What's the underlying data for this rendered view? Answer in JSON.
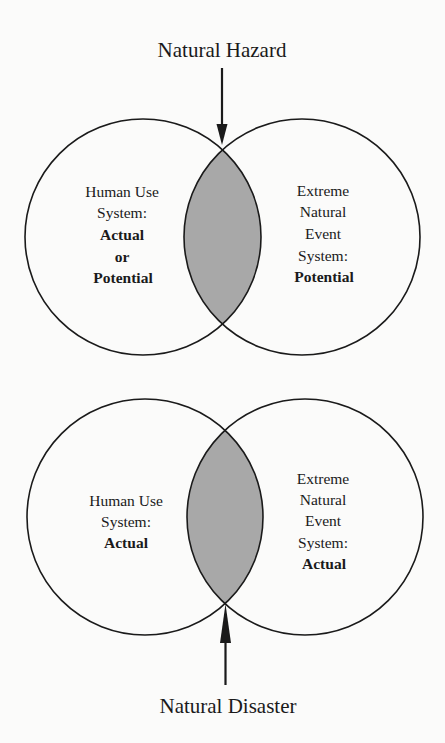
{
  "diagrams": [
    {
      "title": "Natural Hazard",
      "arrow_direction": "down",
      "left_circle": {
        "lines": [
          "Human Use",
          "System:",
          "Actual",
          "or",
          "Potential"
        ],
        "bold_from": 2
      },
      "right_circle": {
        "lines": [
          "Extreme",
          "Natural",
          "Event",
          "System:",
          "Potential"
        ],
        "bold_from": 4
      }
    },
    {
      "title": "Natural Disaster",
      "arrow_direction": "up",
      "left_circle": {
        "lines": [
          "Human Use",
          "System:",
          "Actual"
        ],
        "bold_from": 2
      },
      "right_circle": {
        "lines": [
          "Extreme",
          "Natural",
          "Event",
          "System:",
          "Actual"
        ],
        "bold_from": 4
      }
    }
  ],
  "colors": {
    "stroke": "#1a1a1a",
    "overlap_fill": "#a8a8a8",
    "background": "#fbfbfa"
  }
}
